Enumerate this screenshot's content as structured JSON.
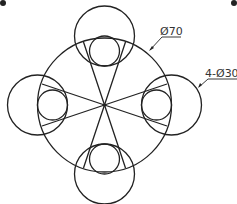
{
  "diagram": {
    "type": "technical-drawing",
    "stroke_color": "#222222",
    "background": "#ffffff",
    "main_circle": {
      "cx": 104.5,
      "cy": 105,
      "r": 67,
      "dimension_label": "Ø70"
    },
    "outer_circles": {
      "count": 4,
      "r": 30,
      "dimension_label": "4-Ø30",
      "centers": [
        [
          104.5,
          36
        ],
        [
          37.5,
          105
        ],
        [
          171.5,
          105
        ],
        [
          104.5,
          174
        ]
      ]
    },
    "inner_circles": {
      "r": 15,
      "centers": [
        [
          104.5,
          51
        ],
        [
          52.5,
          105
        ],
        [
          156.5,
          105
        ],
        [
          104.5,
          159
        ]
      ]
    },
    "labels": {
      "diameter_main": "Ø70",
      "diameter_outer": "4-Ø30"
    }
  }
}
